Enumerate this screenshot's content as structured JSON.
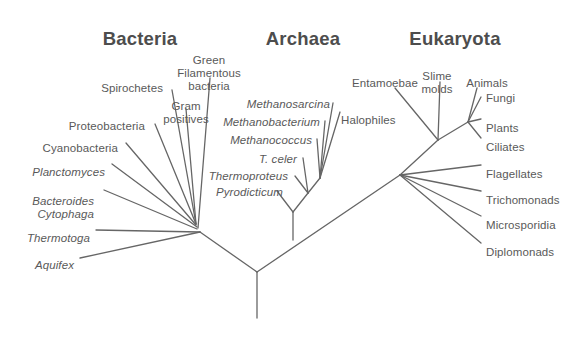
{
  "figure": {
    "kind": "phylogenetic-tree-of-life",
    "background_color": "#ffffff",
    "line_color": "#666666",
    "label_color": "#595959",
    "title_color": "#4d4d4d",
    "width": 580,
    "height": 338
  },
  "domains": [
    {
      "id": "bacteria",
      "label": "Bacteria",
      "x": 140,
      "y": 28
    },
    {
      "id": "archaea",
      "label": "Archaea",
      "x": 303,
      "y": 28
    },
    {
      "id": "eukaryota",
      "label": "Eukaryota",
      "x": 455,
      "y": 28
    }
  ],
  "labels": {
    "bacteria": [
      {
        "id": "spirochetes",
        "text": "Spirochetes",
        "italic": false,
        "align": "end",
        "x": 163,
        "y": 82
      },
      {
        "id": "green-filamentous",
        "text": "Green\nFilamentous\nbacteria",
        "italic": false,
        "align": "mid",
        "x": 209,
        "y": 54
      },
      {
        "id": "gram-positives",
        "text": "Gram\npositives",
        "italic": false,
        "align": "mid",
        "x": 186,
        "y": 100
      },
      {
        "id": "proteobacteria",
        "text": "Proteobacteria",
        "italic": false,
        "align": "end",
        "x": 145,
        "y": 120
      },
      {
        "id": "cyanobacteria",
        "text": "Cyanobacteria",
        "italic": false,
        "align": "end",
        "x": 118,
        "y": 142
      },
      {
        "id": "planctomyces",
        "text": "Planctomyces",
        "italic": true,
        "align": "end",
        "x": 105,
        "y": 166
      },
      {
        "id": "bacteroides-cytophaga",
        "text": "Bacteroides\n Cytophaga",
        "italic": true,
        "align": "end",
        "x": 94,
        "y": 195
      },
      {
        "id": "thermotoga",
        "text": "Thermotoga",
        "italic": true,
        "align": "end",
        "x": 90,
        "y": 232
      },
      {
        "id": "aquifex",
        "text": "Aquifex",
        "italic": true,
        "align": "end",
        "x": 74,
        "y": 259
      }
    ],
    "archaea": [
      {
        "id": "methanosarcina",
        "text": "Methanosarcina",
        "italic": true,
        "align": "end",
        "x": 330,
        "y": 98
      },
      {
        "id": "methanobacterium",
        "text": "Methanobacterium",
        "italic": true,
        "align": "end",
        "x": 320,
        "y": 116
      },
      {
        "id": "methanococcus",
        "text": "Methanococcus",
        "italic": true,
        "align": "end",
        "x": 312,
        "y": 134
      },
      {
        "id": "t-celer",
        "text": "T. celer",
        "italic": true,
        "align": "end",
        "x": 297,
        "y": 153
      },
      {
        "id": "thermoproteus",
        "text": "Thermoproteus",
        "italic": true,
        "align": "end",
        "x": 288,
        "y": 170
      },
      {
        "id": "pyrodicticum",
        "text": "Pyrodicticum",
        "italic": true,
        "align": "end",
        "x": 283,
        "y": 186
      },
      {
        "id": "halophiles",
        "text": "Halophiles",
        "italic": false,
        "align": "start",
        "x": 341,
        "y": 114
      }
    ],
    "eukaryota": [
      {
        "id": "entamoebae",
        "text": "Entamoebae",
        "italic": false,
        "align": "mid",
        "x": 385,
        "y": 77
      },
      {
        "id": "slime-molds",
        "text": "Slime\nmolds",
        "italic": false,
        "align": "mid",
        "x": 437,
        "y": 70
      },
      {
        "id": "animals",
        "text": "Animals",
        "italic": false,
        "align": "mid",
        "x": 487,
        "y": 77
      },
      {
        "id": "fungi",
        "text": "Fungi",
        "italic": false,
        "align": "start",
        "x": 486,
        "y": 92
      },
      {
        "id": "plants",
        "text": "Plants",
        "italic": false,
        "align": "start",
        "x": 486,
        "y": 122
      },
      {
        "id": "ciliates",
        "text": "Ciliates",
        "italic": false,
        "align": "start",
        "x": 486,
        "y": 141
      },
      {
        "id": "flagellates",
        "text": "Flagellates",
        "italic": false,
        "align": "start",
        "x": 486,
        "y": 168
      },
      {
        "id": "trichomonads",
        "text": "Trichomonads",
        "italic": false,
        "align": "start",
        "x": 486,
        "y": 194
      },
      {
        "id": "microsporidia",
        "text": "Microsporidia",
        "italic": false,
        "align": "start",
        "x": 486,
        "y": 219
      },
      {
        "id": "diplomonads",
        "text": "Diplomonads",
        "italic": false,
        "align": "start",
        "x": 486,
        "y": 246
      }
    ]
  },
  "tree_edges": [
    {
      "id": "root-stem",
      "from": [
        257,
        318
      ],
      "to": [
        257,
        272
      ]
    },
    {
      "id": "root-to-bacteria",
      "from": [
        257,
        272
      ],
      "to": [
        200,
        232
      ]
    },
    {
      "id": "root-to-arch-euk",
      "from": [
        257,
        272
      ],
      "to": [
        400,
        175
      ]
    },
    {
      "id": "bact-node-to-aquifex",
      "from": [
        200,
        232
      ],
      "to": [
        80,
        258
      ]
    },
    {
      "id": "bact-node-to-thermotoga",
      "from": [
        200,
        232
      ],
      "to": [
        96,
        230
      ]
    },
    {
      "id": "bact-node-to-bact-cyto",
      "from": [
        197,
        229
      ],
      "to": [
        104,
        190
      ]
    },
    {
      "id": "bact-node-to-planctomyces",
      "from": [
        197,
        227
      ],
      "to": [
        112,
        164
      ]
    },
    {
      "id": "bact-node-to-cyano",
      "from": [
        196,
        225
      ],
      "to": [
        126,
        143
      ]
    },
    {
      "id": "bact-node-to-proteo",
      "from": [
        196,
        224
      ],
      "to": [
        155,
        124
      ]
    },
    {
      "id": "bact-node-to-spirochetes",
      "from": [
        196,
        224
      ],
      "to": [
        172,
        90
      ]
    },
    {
      "id": "bact-node-to-gram",
      "from": [
        196,
        224
      ],
      "to": [
        186,
        109
      ]
    },
    {
      "id": "bact-node-to-greenfil",
      "from": [
        198,
        228
      ],
      "to": [
        210,
        78
      ]
    },
    {
      "id": "arch-stem",
      "from": [
        293,
        240
      ],
      "to": [
        293,
        212
      ]
    },
    {
      "id": "arch-to-pyrodicticum",
      "from": [
        293,
        212
      ],
      "to": [
        277,
        191
      ]
    },
    {
      "id": "arch-to-crown",
      "from": [
        293,
        212
      ],
      "to": [
        308,
        193
      ]
    },
    {
      "id": "crown-to-thermoproteus",
      "from": [
        308,
        193
      ],
      "to": [
        295,
        176
      ]
    },
    {
      "id": "crown-to-tceler",
      "from": [
        308,
        193
      ],
      "to": [
        303,
        158
      ]
    },
    {
      "id": "crown-to-upper",
      "from": [
        308,
        193
      ],
      "to": [
        320,
        178
      ]
    },
    {
      "id": "upper-to-methanococcus",
      "from": [
        320,
        178
      ],
      "to": [
        317,
        139
      ]
    },
    {
      "id": "upper-to-methanobact",
      "from": [
        320,
        178
      ],
      "to": [
        325,
        121
      ]
    },
    {
      "id": "upper-to-methanosarc",
      "from": [
        320,
        178
      ],
      "to": [
        333,
        103
      ]
    },
    {
      "id": "upper-to-halophiles",
      "from": [
        320,
        178
      ],
      "to": [
        340,
        112
      ]
    },
    {
      "id": "euk-to-diplomonads",
      "from": [
        400,
        175
      ],
      "to": [
        481,
        243
      ]
    },
    {
      "id": "euk-to-microsporidia",
      "from": [
        400,
        175
      ],
      "to": [
        481,
        216
      ]
    },
    {
      "id": "euk-to-trichomonads",
      "from": [
        400,
        175
      ],
      "to": [
        481,
        191
      ]
    },
    {
      "id": "euk-to-flagellates",
      "from": [
        400,
        175
      ],
      "to": [
        481,
        165
      ]
    },
    {
      "id": "euk-to-crown",
      "from": [
        400,
        175
      ],
      "to": [
        438,
        140
      ]
    },
    {
      "id": "euk-crown-to-entamoebae",
      "from": [
        438,
        140
      ],
      "to": [
        395,
        88
      ]
    },
    {
      "id": "euk-crown-to-slimemolds",
      "from": [
        438,
        140
      ],
      "to": [
        440,
        82
      ]
    },
    {
      "id": "euk-crown-to-upper",
      "from": [
        438,
        140
      ],
      "to": [
        468,
        122
      ]
    },
    {
      "id": "euk-upper-to-ciliates",
      "from": [
        468,
        122
      ],
      "to": [
        481,
        138
      ]
    },
    {
      "id": "euk-upper-to-plants",
      "from": [
        468,
        122
      ],
      "to": [
        481,
        119
      ]
    },
    {
      "id": "euk-upper-to-fungi",
      "from": [
        468,
        122
      ],
      "to": [
        481,
        97
      ]
    },
    {
      "id": "euk-upper-to-animals",
      "from": [
        468,
        122
      ],
      "to": [
        477,
        88
      ]
    }
  ]
}
